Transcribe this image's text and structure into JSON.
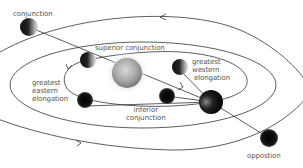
{
  "diagram": {
    "labels": {
      "conjunction": "conjunction",
      "superior_conjunction": "superior conjunction",
      "greatest_western_elongation": [
        "greatest",
        "western",
        "elongation"
      ],
      "greatest_eastern_elongation": [
        "greatest",
        "eastern",
        "elongation"
      ],
      "inferior_conjunction": [
        "inferior",
        "conjunction"
      ],
      "opposition": "oppostion"
    },
    "colors": {
      "line": "#333333",
      "text": "#555555",
      "sun": "#9a9a9a",
      "planet_dark": "#111111",
      "background": "#ffffff"
    }
  }
}
